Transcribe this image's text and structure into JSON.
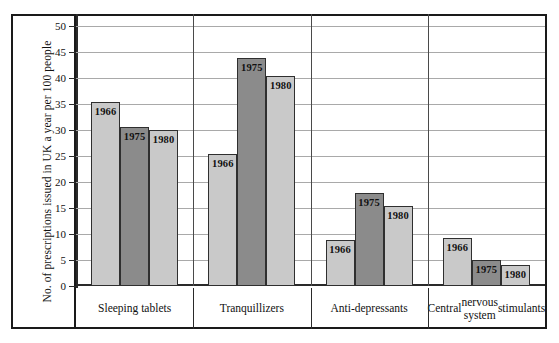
{
  "chart_data": {
    "type": "bar",
    "title": "",
    "xlabel": "",
    "ylabel": "No. of prescriptions issued in UK a year per 100 people",
    "ylim": [
      0,
      52
    ],
    "yticks": [
      0,
      5,
      10,
      15,
      20,
      25,
      30,
      35,
      40,
      45,
      50
    ],
    "grid": true,
    "legend_position": "in-bar-labels",
    "categories": [
      "Sleeping tablets",
      "Tranquillizers",
      "Anti-depressants",
      "Central\nnervous system\nstimulants"
    ],
    "series": [
      {
        "name": "1966",
        "color": "#c9c9c9",
        "values": [
          35.5,
          25.5,
          8.8,
          9.2
        ]
      },
      {
        "name": "1975",
        "color": "#8b8b8b",
        "values": [
          30.7,
          44.0,
          18.0,
          5.0
        ]
      },
      {
        "name": "1980",
        "color": "#c9c9c9",
        "values": [
          30.0,
          40.5,
          15.4,
          4.0
        ]
      }
    ]
  },
  "colors": {
    "light_bar": "#c9c9c9",
    "dark_bar": "#8b8b8b",
    "frame": "#1a1a1a",
    "gridline": "#a9a9a9",
    "text": "#111111"
  }
}
